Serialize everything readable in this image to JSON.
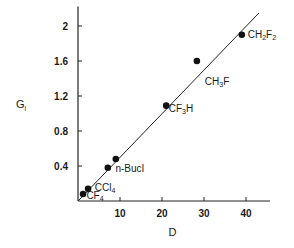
{
  "chart_data": {
    "type": "scatter",
    "title": "",
    "xlabel": "D",
    "ylabel": "G",
    "ylabel_sub": "i",
    "xlim": [
      0,
      45.7
    ],
    "ylim": [
      0,
      2.2
    ],
    "grid": false,
    "xticks": [
      10,
      20,
      30,
      40
    ],
    "xtick_labels": [
      "10",
      "20",
      "30",
      "40"
    ],
    "yticks": [
      0.4,
      0.8,
      1.2,
      1.6,
      2.0
    ],
    "ytick_labels": [
      "0.4",
      "0.8",
      "1.2",
      "1.6",
      "2"
    ],
    "points": [
      {
        "x": 1.2,
        "y": 0.08,
        "label": ""
      },
      {
        "x": 2.4,
        "y": 0.14,
        "label": ""
      },
      {
        "x": 7.1,
        "y": 0.38,
        "label": ""
      },
      {
        "x": 9.0,
        "y": 0.48,
        "label": ""
      },
      {
        "x": 21.0,
        "y": 1.09,
        "label": ""
      },
      {
        "x": 28.3,
        "y": 1.6,
        "label": ""
      },
      {
        "x": 39.0,
        "y": 1.9,
        "label": ""
      }
    ],
    "annotations": [
      {
        "text": "CF",
        "sub": "4",
        "x": 2.0,
        "y": 0.02
      },
      {
        "text": "CCl",
        "sub": "4",
        "x": 4.0,
        "y": 0.12
      },
      {
        "text": "n-BucI",
        "sub": "",
        "x": 8.9,
        "y": 0.33
      },
      {
        "text": "CF",
        "sub": "3",
        "tail": "H",
        "x": 21.6,
        "y": 1.02
      },
      {
        "text": "CH",
        "sub": "3",
        "tail": "F",
        "x": 30.2,
        "y": 1.33
      },
      {
        "text": "CH",
        "sub": "2",
        "tail": "F",
        "sub2": "2",
        "x": 40.4,
        "y": 1.86
      }
    ],
    "fit_line": {
      "x0": 0,
      "y0": 0,
      "x1": 43.1,
      "y1": 2.15
    }
  }
}
